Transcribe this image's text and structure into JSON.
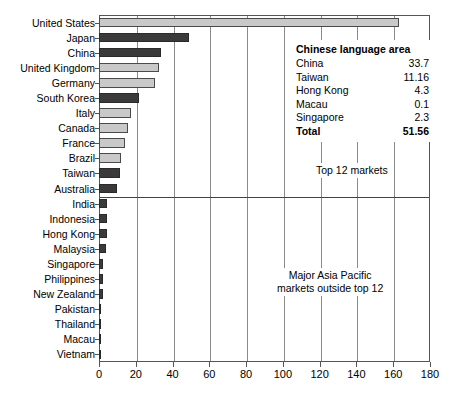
{
  "chart_data": {
    "type": "bar",
    "orientation": "horizontal",
    "title": "",
    "subtitle": "",
    "xlabel": "",
    "ylabel": "",
    "xlim": [
      0,
      180
    ],
    "xticks": [
      0,
      20,
      40,
      60,
      80,
      100,
      120,
      140,
      160,
      180
    ],
    "xticklabels": [
      "0",
      "20",
      "40",
      "60",
      "80",
      "100",
      "120",
      "140",
      "160",
      "180"
    ],
    "grid": "vertical",
    "legend": "none",
    "categories": [
      "United States",
      "Japan",
      "China",
      "United Kingdom",
      "Germany",
      "South Korea",
      "Italy",
      "Canada",
      "France",
      "Brazil",
      "Taiwan",
      "Australia",
      "India",
      "Indonesia",
      "Hong Kong",
      "Malaysia",
      "Singapore",
      "Philippines",
      "New Zealand",
      "Pakistan",
      "Thailand",
      "Macau",
      "Vietnam"
    ],
    "values": [
      163,
      49,
      33.7,
      32.5,
      30.5,
      21.5,
      17.5,
      16,
      14,
      12,
      11.16,
      10,
      4.5,
      4.3,
      4.3,
      3.7,
      2.3,
      2.0,
      2.3,
      0.7,
      0.6,
      0.1,
      0.05
    ],
    "bar_shades": [
      "light",
      "dark",
      "dark",
      "light",
      "light",
      "dark",
      "light",
      "light",
      "light",
      "light",
      "dark",
      "dark",
      "dark",
      "dark",
      "dark",
      "dark",
      "dark",
      "dark",
      "dark",
      "dark",
      "dark",
      "dark",
      "dark"
    ],
    "group_divider_after_index": 11,
    "annotations": [
      {
        "name": "top-12-markets",
        "text": "Top 12 markets"
      },
      {
        "name": "major-asia-pacific",
        "line1": "Major Asia Pacific",
        "line2": "markets outside top 12"
      }
    ],
    "inset_table": {
      "title": "Chinese language area",
      "rows": [
        {
          "name": "China",
          "value": "33.7"
        },
        {
          "name": "Taiwan",
          "value": "11.16"
        },
        {
          "name": "Hong Kong",
          "value": "4.3"
        },
        {
          "name": "Macau",
          "value": "0.1"
        },
        {
          "name": "Singapore",
          "value": "2.3"
        }
      ],
      "total_label": "Total",
      "total_value": "51.56"
    },
    "colors": {
      "bar_light": "#c9c9c9",
      "bar_dark": "#3a3a3a",
      "gridline": "#8a8a8a",
      "frame": "#555555",
      "background": "#ffffff",
      "text": "#000000"
    }
  }
}
